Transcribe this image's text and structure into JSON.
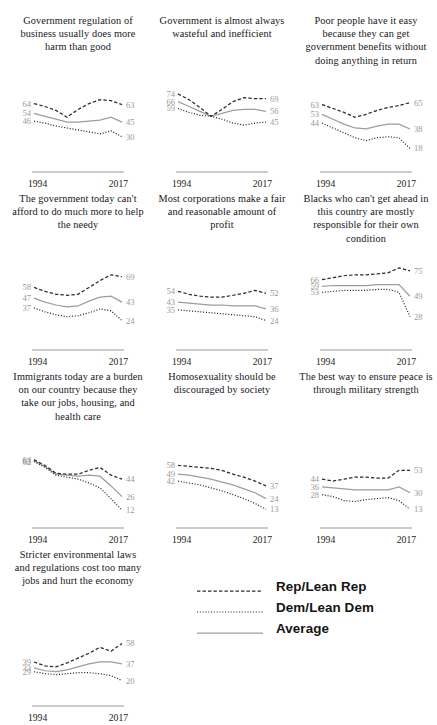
{
  "figure": {
    "type": "small-multiples-line",
    "x_axis_start_label": "1994",
    "x_axis_end_label": "2017",
    "value_scale": [
      0,
      80
    ],
    "series_styles": {
      "rep": "dashed",
      "dem": "dotted",
      "avg": "solid"
    },
    "colors": {
      "line_dark": "#2b2b2b",
      "line_gray": "#9d9d9d",
      "value_label": "#9a9a9a",
      "title_text": "#16161a",
      "background": "#ffffff"
    }
  },
  "legend": {
    "position": "bottom-right",
    "items": [
      {
        "label": "Rep/Lean Rep",
        "style": "dashed",
        "icon": "dashed-line-icon"
      },
      {
        "label": "Dem/Lean Dem",
        "style": "dotted",
        "icon": "dotted-line-icon"
      },
      {
        "label": "Average",
        "style": "solid",
        "icon": "solid-line-icon"
      }
    ]
  },
  "chart_data": {
    "type": "line",
    "title": "",
    "xlabel": "",
    "ylabel": "",
    "x": [
      "1994",
      "1999",
      "2004",
      "2009",
      "2011",
      "2014",
      "2015",
      "2016",
      "2017"
    ],
    "xlim": [
      "1994",
      "2017"
    ],
    "ylim": [
      0,
      80
    ],
    "grid": false,
    "legend_position": "bottom-right",
    "panels": [
      {
        "title": "Government regulation of business usually does more harm than good",
        "start_labels": [
          "64",
          "54",
          "46"
        ],
        "end_labels": [
          "63",
          "45",
          "30"
        ],
        "series": [
          {
            "name": "Rep/Lean Rep",
            "key": "rep",
            "values": [
              64,
              61,
              57,
              50,
              58,
              64,
              68,
              67,
              63
            ]
          },
          {
            "name": "Average",
            "key": "avg",
            "values": [
              54,
              51,
              48,
              45,
              45,
              46,
              47,
              50,
              45
            ]
          },
          {
            "name": "Dem/Lean Dem",
            "key": "dem",
            "values": [
              46,
              44,
              41,
              39,
              37,
              35,
              33,
              36,
              30
            ]
          }
        ]
      },
      {
        "title": "Government is almost always wasteful and inefficient",
        "start_labels": [
          "74",
          "66",
          "59"
        ],
        "end_labels": [
          "69",
          "56",
          "45"
        ],
        "series": [
          {
            "name": "Rep/Lean Rep",
            "key": "rep",
            "values": [
              74,
              68,
              60,
              51,
              58,
              66,
              70,
              69,
              69
            ]
          },
          {
            "name": "Average",
            "key": "avg",
            "values": [
              66,
              61,
              56,
              51,
              54,
              57,
              58,
              58,
              56
            ]
          },
          {
            "name": "Dem/Lean Dem",
            "key": "dem",
            "values": [
              59,
              55,
              52,
              51,
              48,
              44,
              42,
              44,
              45
            ]
          }
        ]
      },
      {
        "title": "Poor people have it easy because they can get government benefits without doing anything in return",
        "start_labels": [
          "63",
          "53",
          "44"
        ],
        "end_labels": [
          "65",
          "38",
          "18"
        ],
        "series": [
          {
            "name": "Rep/Lean Rep",
            "key": "rep",
            "values": [
              63,
              59,
              55,
              50,
              53,
              57,
              60,
              62,
              65
            ]
          },
          {
            "name": "Average",
            "key": "avg",
            "values": [
              53,
              48,
              43,
              39,
              38,
              41,
              43,
              43,
              38
            ]
          },
          {
            "name": "Dem/Lean Dem",
            "key": "dem",
            "values": [
              44,
              39,
              34,
              29,
              26,
              29,
              30,
              29,
              18
            ]
          }
        ]
      },
      {
        "title": "The government today can't afford to do much more to help the needy",
        "start_labels": [
          "58",
          "47",
          "37"
        ],
        "end_labels": [
          "69",
          "43",
          "24"
        ],
        "series": [
          {
            "name": "Rep/Lean Rep",
            "key": "rep",
            "values": [
              58,
              54,
              51,
              50,
              51,
              58,
              65,
              71,
              69
            ]
          },
          {
            "name": "Average",
            "key": "avg",
            "values": [
              47,
              43,
              40,
              38,
              39,
              44,
              48,
              49,
              43
            ]
          },
          {
            "name": "Dem/Lean Dem",
            "key": "dem",
            "values": [
              37,
              33,
              30,
              28,
              29,
              32,
              36,
              34,
              24
            ]
          }
        ]
      },
      {
        "title": "Most corporations make a fair and reasonable amount of profit",
        "start_labels": [
          "54",
          "43",
          "35"
        ],
        "end_labels": [
          "52",
          "36",
          "24"
        ],
        "series": [
          {
            "name": "Rep/Lean Rep",
            "key": "rep",
            "values": [
              54,
              51,
              49,
              48,
              48,
              50,
              52,
              55,
              52
            ]
          },
          {
            "name": "Average",
            "key": "avg",
            "values": [
              43,
              42,
              41,
              40,
              40,
              39,
              39,
              39,
              36
            ]
          },
          {
            "name": "Dem/Lean Dem",
            "key": "dem",
            "values": [
              35,
              34,
              33,
              32,
              31,
              30,
              29,
              28,
              24
            ]
          }
        ]
      },
      {
        "title": "Blacks who can't get ahead in this country are mostly responsible for their own condition",
        "start_labels": [
          "66",
          "59",
          "53"
        ],
        "end_labels": [
          "75",
          "49",
          "28"
        ],
        "series": [
          {
            "name": "Rep/Lean Rep",
            "key": "rep",
            "values": [
              66,
              68,
              70,
              71,
              71,
              72,
              73,
              78,
              75
            ]
          },
          {
            "name": "Average",
            "key": "avg",
            "values": [
              59,
              60,
              60,
              60,
              60,
              61,
              61,
              61,
              49
            ]
          },
          {
            "name": "Dem/Lean Dem",
            "key": "dem",
            "values": [
              53,
              54,
              55,
              55,
              55,
              56,
              56,
              53,
              28
            ]
          }
        ]
      },
      {
        "title": "Immigrants today are a burden on our country because they take our jobs, housing, and health care",
        "start_labels": [
          "64",
          "63",
          "62"
        ],
        "end_labels": [
          "44",
          "26",
          "12"
        ],
        "series": [
          {
            "name": "Rep/Lean Rep",
            "key": "rep",
            "values": [
              64,
              58,
              50,
              49,
              49,
              53,
              56,
              48,
              44
            ]
          },
          {
            "name": "Average",
            "key": "avg",
            "values": [
              63,
              57,
              49,
              48,
              47,
              48,
              47,
              37,
              26
            ]
          },
          {
            "name": "Dem/Lean Dem",
            "key": "dem",
            "values": [
              62,
              56,
              48,
              46,
              44,
              40,
              35,
              24,
              12
            ]
          }
        ]
      },
      {
        "title": "Homosexuality should be discouraged by society",
        "start_labels": [
          "58",
          "49",
          "42"
        ],
        "end_labels": [
          "37",
          "24",
          "13"
        ],
        "series": [
          {
            "name": "Rep/Lean Rep",
            "key": "rep",
            "values": [
              58,
              57,
              56,
              55,
              53,
              49,
              46,
              42,
              37
            ]
          },
          {
            "name": "Average",
            "key": "avg",
            "values": [
              49,
              48,
              46,
              44,
              41,
              38,
              34,
              30,
              24
            ]
          },
          {
            "name": "Dem/Lean Dem",
            "key": "dem",
            "values": [
              42,
              40,
              38,
              35,
              32,
              28,
              24,
              19,
              13
            ]
          }
        ]
      },
      {
        "title": "The best way to ensure peace is through military strength",
        "start_labels": [
          "44",
          "36",
          "28"
        ],
        "end_labels": [
          "53",
          "30",
          "13"
        ],
        "series": [
          {
            "name": "Rep/Lean Rep",
            "key": "rep",
            "values": [
              44,
              42,
              44,
              46,
              46,
              45,
              45,
              53,
              53
            ]
          },
          {
            "name": "Average",
            "key": "avg",
            "values": [
              36,
              35,
              34,
              33,
              33,
              33,
              33,
              36,
              30
            ]
          },
          {
            "name": "Dem/Lean Dem",
            "key": "dem",
            "values": [
              28,
              26,
              22,
              21,
              23,
              24,
              25,
              22,
              13
            ]
          }
        ]
      },
      {
        "title": "Stricter environmental laws and regulations cost too many jobs and hurt the economy",
        "start_labels": [
          "39",
          "33",
          "29"
        ],
        "end_labels": [
          "58",
          "37",
          "20"
        ],
        "series": [
          {
            "name": "Rep/Lean Rep",
            "key": "rep",
            "values": [
              39,
              35,
              34,
              38,
              43,
              48,
              54,
              50,
              58
            ]
          },
          {
            "name": "Average",
            "key": "avg",
            "values": [
              33,
              30,
              29,
              31,
              34,
              37,
              39,
              39,
              37
            ]
          },
          {
            "name": "Dem/Lean Dem",
            "key": "dem",
            "values": [
              29,
              27,
              26,
              27,
              28,
              28,
              27,
              25,
              20
            ]
          }
        ]
      }
    ]
  }
}
